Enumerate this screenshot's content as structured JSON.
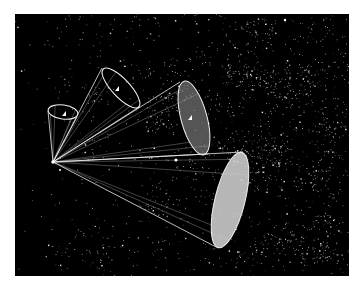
{
  "figure": {
    "background_color": "#000000",
    "page_color": "#ffffff",
    "frame": {
      "x": 15,
      "y": 14,
      "width": 334,
      "height": 262
    },
    "apex": {
      "x": 53,
      "y": 162,
      "r": 1.8
    },
    "cones": [
      {
        "id": "cone-1",
        "ellipse": {
          "cx": 63,
          "cy": 112,
          "rx": 15,
          "ry": 7,
          "rotate": 8,
          "fill": "none",
          "fill_opacity": 0
        },
        "edge_points": [
          [
            48,
            111
          ],
          [
            77,
            117
          ]
        ],
        "marker": {
          "x": 64,
          "y": 114
        }
      },
      {
        "id": "cone-2",
        "ellipse": {
          "cx": 121,
          "cy": 88,
          "rx": 26,
          "ry": 9,
          "rotate": 47,
          "fill": "none",
          "fill_opacity": 0
        },
        "edge_points": [
          [
            102,
            68
          ],
          [
            139,
            107
          ]
        ],
        "marker": {
          "x": 117,
          "y": 89
        }
      },
      {
        "id": "cone-3",
        "ellipse": {
          "cx": 194,
          "cy": 118,
          "rx": 38,
          "ry": 13,
          "rotate": 75,
          "fill": "#9a9a9a",
          "fill_opacity": 0.55
        },
        "edge_points": [
          [
            180,
            82
          ],
          [
            208,
            154
          ]
        ],
        "marker": {
          "x": 190,
          "y": 118
        }
      },
      {
        "id": "cone-4",
        "ellipse": {
          "cx": 230,
          "cy": 200,
          "rx": 49,
          "ry": 15,
          "rotate": -76,
          "fill": "#d6d6d6",
          "fill_opacity": 0.85
        },
        "edge_points": [
          [
            243,
            152
          ],
          [
            218,
            248
          ]
        ],
        "marker": null
      }
    ],
    "stray_objects": [
      {
        "x": 176,
        "y": 160,
        "r": 1.6
      },
      {
        "x": 60,
        "y": 170,
        "r": 1.0
      },
      {
        "x": 285,
        "y": 20,
        "r": 1.2
      }
    ],
    "star_field": {
      "count": 2600,
      "seed": 7,
      "density_gradient": "denser toward right, sparse on left edge"
    }
  }
}
